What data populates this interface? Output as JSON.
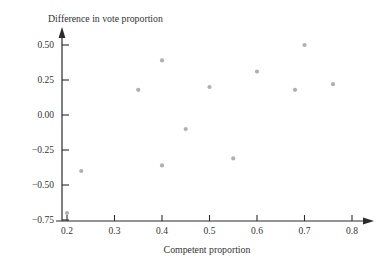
{
  "chart_data": {
    "type": "scatter",
    "title": "",
    "xlabel": "Competent proportion",
    "ylabel": "Difference in vote proportion",
    "xlim": [
      0.17,
      0.83
    ],
    "ylim": [
      -0.78,
      0.6
    ],
    "xticks": [
      "0.2",
      "0.3",
      "0.4",
      "0.5",
      "0.6",
      "0.7",
      "0.8"
    ],
    "xtick_values": [
      0.2,
      0.3,
      0.4,
      0.5,
      0.6,
      0.7,
      0.8
    ],
    "yticks": [
      "0.50",
      "0.25",
      "0.00",
      "−0.25",
      "−0.50",
      "−0.75"
    ],
    "ytick_values": [
      0.5,
      0.25,
      0.0,
      -0.25,
      -0.5,
      -0.75
    ],
    "grid": false,
    "legend": "none",
    "marker": "circle",
    "marker_color": "#b0b0b0",
    "marker_size": 4,
    "axis_color": "#2b2b2b",
    "points": [
      {
        "x": 0.2,
        "y": -0.7
      },
      {
        "x": 0.23,
        "y": -0.4
      },
      {
        "x": 0.35,
        "y": 0.18
      },
      {
        "x": 0.4,
        "y": 0.39
      },
      {
        "x": 0.4,
        "y": -0.36
      },
      {
        "x": 0.45,
        "y": -0.1
      },
      {
        "x": 0.5,
        "y": 0.2
      },
      {
        "x": 0.55,
        "y": -0.31
      },
      {
        "x": 0.6,
        "y": 0.31
      },
      {
        "x": 0.68,
        "y": 0.18
      },
      {
        "x": 0.7,
        "y": 0.5
      },
      {
        "x": 0.76,
        "y": 0.22
      }
    ],
    "n_points": 12
  }
}
